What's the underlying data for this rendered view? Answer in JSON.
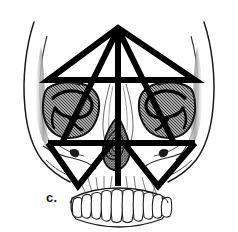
{
  "figure": {
    "label": "c.",
    "background_color": "#ffffff",
    "ink_color": "#000000",
    "outline_color": "#1a1a1a",
    "overlay_color": "#000000",
    "shading_color": "#6e6e6e",
    "hatch_color": "#4a4a4a",
    "tooth_fill": "#ffffff"
  },
  "anatomy": {
    "parts": [
      {
        "name": "cranial-vault-outline",
        "label": "Cranial vault"
      },
      {
        "name": "left-temporal-shading",
        "label": "Left temporal fossa"
      },
      {
        "name": "right-temporal-shading",
        "label": "Right temporal fossa"
      },
      {
        "name": "left-orbit",
        "label": "Left orbit"
      },
      {
        "name": "right-orbit",
        "label": "Right orbit"
      },
      {
        "name": "nasal-aperture",
        "label": "Piriform aperture"
      },
      {
        "name": "left-zygomatic-arch",
        "label": "Left zygomatic arch"
      },
      {
        "name": "right-zygomatic-arch",
        "label": "Right zygomatic arch"
      },
      {
        "name": "maxillary-dental-arch",
        "label": "Maxillary teeth"
      }
    ],
    "tooth_count": 14
  },
  "overlay": {
    "name": "craniofacial-triangle-overlay",
    "stroke_width_px": 6,
    "elements": [
      {
        "name": "upper-triangle",
        "label": "Upper triangle",
        "apex": [
          118,
          28
        ],
        "left": [
          48,
          80
        ],
        "right": [
          195,
          80
        ]
      },
      {
        "name": "midline-axis",
        "label": "Vertical midline",
        "from": [
          118,
          28
        ],
        "to": [
          118,
          186
        ]
      },
      {
        "name": "upper-base-line",
        "label": "Supraorbital horizontal",
        "from": [
          48,
          80
        ],
        "to": [
          195,
          80
        ]
      },
      {
        "name": "lower-base-line",
        "label": "Infraorbital horizontal",
        "from": [
          48,
          143
        ],
        "to": [
          195,
          143
        ]
      },
      {
        "name": "inverted-triangle",
        "label": "Inverted midface triangle",
        "apex": [
          118,
          80
        ],
        "left": [
          62,
          143
        ],
        "right": [
          174,
          143
        ]
      },
      {
        "name": "left-lower-triangle",
        "label": "Left inverted triangle",
        "apex": [
          78,
          186
        ],
        "left": [
          48,
          143
        ],
        "right": [
          112,
          143
        ]
      },
      {
        "name": "right-lower-triangle",
        "label": "Right inverted triangle",
        "apex": [
          158,
          186
        ],
        "left": [
          124,
          143
        ],
        "right": [
          195,
          143
        ]
      }
    ]
  }
}
